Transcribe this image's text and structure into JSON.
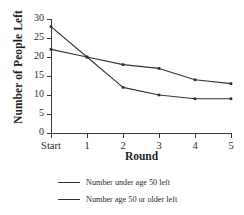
{
  "chart_data": {
    "type": "line",
    "title": "",
    "xlabel": "Round",
    "ylabel": "Number of People Left",
    "categories": [
      "Start",
      "1",
      "2",
      "3",
      "4",
      "5"
    ],
    "series": [
      {
        "name": "Number under age 50 left",
        "values": [
          22,
          20,
          18,
          17,
          14,
          13
        ]
      },
      {
        "name": "Number age 50 or older left",
        "values": [
          28,
          20,
          12,
          10,
          9,
          9
        ]
      }
    ],
    "ylim": [
      0,
      30
    ],
    "yticks": [
      0,
      5,
      10,
      15,
      20,
      25,
      30
    ],
    "ytick_labels": [
      "0",
      "5",
      "10",
      "15",
      "20",
      "25",
      "30"
    ],
    "grid": false,
    "legend_position": "below",
    "line_color": "#333333",
    "marker": "square",
    "background": "#ffffff"
  }
}
